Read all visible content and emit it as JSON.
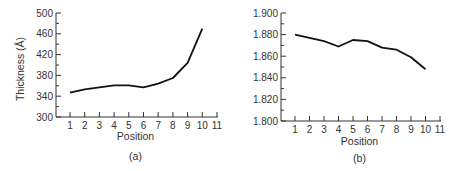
{
  "chart_data": [
    {
      "type": "line",
      "panel_label": "(a)",
      "title": "",
      "xlabel": "Position",
      "ylabel": "Thickness (Å)",
      "x": [
        1,
        2,
        3,
        4,
        5,
        6,
        7,
        8,
        9,
        10
      ],
      "values": [
        347,
        353,
        357,
        361,
        361,
        357,
        364,
        375,
        404,
        470
      ],
      "xticks": [
        "1",
        "2",
        "3",
        "4",
        "5",
        "6",
        "7",
        "8",
        "9",
        "10",
        "11"
      ],
      "yticks": [
        "300",
        "340",
        "380",
        "420",
        "460",
        "500"
      ],
      "xlim": [
        0,
        11
      ],
      "ylim": [
        300,
        500
      ],
      "grid": false,
      "line_color": "#111111"
    },
    {
      "type": "line",
      "panel_label": "(b)",
      "title": "",
      "xlabel": "Position",
      "ylabel": "",
      "x": [
        1,
        2,
        3,
        4,
        5,
        6,
        7,
        8,
        9,
        10
      ],
      "values": [
        1.88,
        1.877,
        1.874,
        1.869,
        1.875,
        1.874,
        1.868,
        1.866,
        1.859,
        1.848
      ],
      "xticks": [
        "1",
        "2",
        "3",
        "4",
        "5",
        "6",
        "7",
        "8",
        "9",
        "10",
        "11"
      ],
      "yticks": [
        "1.800",
        "1.820",
        "1.840",
        "1.860",
        "1.880",
        "1.900"
      ],
      "xlim": [
        0,
        11
      ],
      "ylim": [
        1.8,
        1.9
      ],
      "grid": false,
      "line_color": "#111111"
    }
  ]
}
